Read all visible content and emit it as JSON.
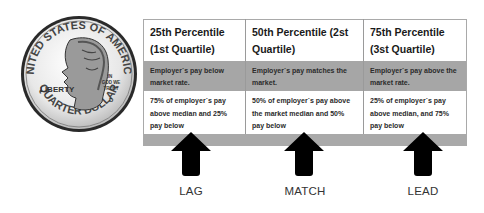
{
  "coin": {
    "top_text": "UNITED STATES OF AMERICA",
    "left_text": "LIBERTY",
    "motto": "IN GOD WE TRUST",
    "mint_mark": "D",
    "bottom_text": "QUARTER DOLLAR"
  },
  "columns": [
    {
      "title": "25th Percentile (1st Quartile)",
      "description": "Employer`s pay below market rate.",
      "detail": "75% of employer`s pay above median and 25% pay below",
      "strategy": "LAG"
    },
    {
      "title": "50th Percentile (2st Quartile)",
      "description": "Employer`s pay matches the market.",
      "detail": "50% of employer`s pay above the market median and 50% pay below",
      "strategy": "MATCH"
    },
    {
      "title": "75th Percentile (3st Quartile)",
      "description": "Employer`s pay above the market rate.",
      "detail": "25% of employer`s pay above median, and 75% pay below",
      "strategy": "LEAD"
    }
  ],
  "colors": {
    "band_grey": "#a6a6a6",
    "arrow": "#000000",
    "text": "#1a1a1a"
  }
}
